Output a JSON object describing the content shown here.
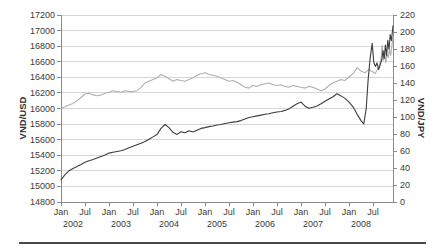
{
  "chart_data": {
    "type": "line",
    "title": "",
    "legend": "none",
    "grid": "horizontal",
    "colors": {
      "grid": "#d6d6d6",
      "axis": "#8c8c8c",
      "text": "#3a3a3a",
      "rule": "#4a4a4a"
    },
    "left_axis": {
      "label": "VND/USD",
      "min": 14800,
      "max": 17200,
      "step": 200,
      "ticks": [
        14800,
        15000,
        15200,
        15400,
        15600,
        15800,
        16000,
        16200,
        16400,
        16600,
        16800,
        17000,
        17200
      ]
    },
    "right_axis": {
      "label": "VND/JPY",
      "min": 0,
      "max": 220,
      "step": 20,
      "ticks": [
        0,
        20,
        40,
        60,
        80,
        100,
        120,
        140,
        160,
        180,
        200,
        220
      ]
    },
    "x_axis": {
      "unit": "months since Jan 2002",
      "range_months": 83,
      "tick_interval_months": 6,
      "tick_labels": [
        "Jan",
        "Jul",
        "Jan",
        "Jul",
        "Jan",
        "Jul",
        "Jan",
        "Jul",
        "Jan",
        "Jul",
        "Jan",
        "Jul",
        "Jan",
        "Jul"
      ],
      "year_labels": [
        "2002",
        "2003",
        "2004",
        "2005",
        "2006",
        "2007",
        "2008"
      ]
    },
    "series": [
      {
        "name": "VND/JPY",
        "axis": "right",
        "color": "#b0b0b0",
        "points": [
          [
            0,
            110
          ],
          [
            1,
            112
          ],
          [
            2,
            114
          ],
          [
            3,
            116
          ],
          [
            4,
            119
          ],
          [
            5,
            123
          ],
          [
            6,
            127
          ],
          [
            7,
            128
          ],
          [
            8,
            126
          ],
          [
            9,
            125
          ],
          [
            10,
            126
          ],
          [
            11,
            128
          ],
          [
            12,
            129
          ],
          [
            13,
            131
          ],
          [
            14,
            130
          ],
          [
            15,
            129
          ],
          [
            16,
            131
          ],
          [
            17,
            130
          ],
          [
            18,
            130
          ],
          [
            19,
            131
          ],
          [
            20,
            135
          ],
          [
            21,
            140
          ],
          [
            22,
            142
          ],
          [
            23,
            144
          ],
          [
            24,
            146
          ],
          [
            25,
            150
          ],
          [
            26,
            148
          ],
          [
            27,
            145
          ],
          [
            28,
            142
          ],
          [
            29,
            144
          ],
          [
            30,
            143
          ],
          [
            31,
            142
          ],
          [
            32,
            144
          ],
          [
            33,
            146
          ],
          [
            34,
            149
          ],
          [
            35,
            151
          ],
          [
            36,
            152
          ],
          [
            37,
            150
          ],
          [
            38,
            149
          ],
          [
            39,
            148
          ],
          [
            40,
            146
          ],
          [
            41,
            144
          ],
          [
            42,
            142
          ],
          [
            43,
            143
          ],
          [
            44,
            141
          ],
          [
            45,
            138
          ],
          [
            46,
            135
          ],
          [
            47,
            134
          ],
          [
            48,
            137
          ],
          [
            49,
            136
          ],
          [
            50,
            138
          ],
          [
            51,
            139
          ],
          [
            52,
            140
          ],
          [
            53,
            138
          ],
          [
            54,
            137
          ],
          [
            55,
            138
          ],
          [
            56,
            136
          ],
          [
            57,
            135
          ],
          [
            58,
            137
          ],
          [
            59,
            136
          ],
          [
            60,
            135
          ],
          [
            61,
            134
          ],
          [
            62,
            136
          ],
          [
            63,
            135
          ],
          [
            64,
            133
          ],
          [
            65,
            131
          ],
          [
            66,
            133
          ],
          [
            67,
            137
          ],
          [
            68,
            140
          ],
          [
            69,
            142
          ],
          [
            70,
            144
          ],
          [
            71,
            143
          ],
          [
            72,
            147
          ],
          [
            73,
            151
          ],
          [
            74,
            158
          ],
          [
            75,
            154
          ],
          [
            76,
            152
          ],
          [
            77,
            156
          ],
          [
            77.5,
            154
          ],
          [
            78,
            153
          ],
          [
            78.5,
            151
          ],
          [
            79,
            155
          ],
          [
            79.5,
            159
          ],
          [
            80,
            168
          ],
          [
            80.3,
            184
          ],
          [
            80.6,
            167
          ],
          [
            80.9,
            177
          ],
          [
            81.2,
            164
          ],
          [
            81.5,
            174
          ],
          [
            81.8,
            170
          ],
          [
            82.1,
            180
          ],
          [
            82.4,
            172
          ],
          [
            83,
            194
          ]
        ]
      },
      {
        "name": "VND/USD",
        "axis": "left",
        "color": "#3d3d3d",
        "points": [
          [
            0,
            15085
          ],
          [
            1,
            15150
          ],
          [
            2,
            15200
          ],
          [
            3,
            15230
          ],
          [
            4,
            15255
          ],
          [
            5,
            15280
          ],
          [
            6,
            15310
          ],
          [
            7,
            15330
          ],
          [
            8,
            15345
          ],
          [
            9,
            15365
          ],
          [
            10,
            15385
          ],
          [
            11,
            15405
          ],
          [
            12,
            15428
          ],
          [
            13,
            15438
          ],
          [
            14,
            15448
          ],
          [
            15,
            15458
          ],
          [
            16,
            15475
          ],
          [
            17,
            15495
          ],
          [
            18,
            15515
          ],
          [
            19,
            15535
          ],
          [
            20,
            15555
          ],
          [
            21,
            15578
          ],
          [
            22,
            15605
          ],
          [
            23,
            15635
          ],
          [
            24,
            15665
          ],
          [
            25,
            15745
          ],
          [
            26,
            15795
          ],
          [
            27,
            15755
          ],
          [
            28,
            15695
          ],
          [
            29,
            15668
          ],
          [
            30,
            15702
          ],
          [
            31,
            15690
          ],
          [
            32,
            15715
          ],
          [
            33,
            15698
          ],
          [
            34,
            15722
          ],
          [
            35,
            15745
          ],
          [
            36,
            15755
          ],
          [
            37,
            15768
          ],
          [
            38,
            15775
          ],
          [
            39,
            15788
          ],
          [
            40,
            15795
          ],
          [
            41,
            15808
          ],
          [
            42,
            15818
          ],
          [
            43,
            15825
          ],
          [
            44,
            15832
          ],
          [
            45,
            15845
          ],
          [
            46,
            15865
          ],
          [
            47,
            15885
          ],
          [
            48,
            15895
          ],
          [
            49,
            15905
          ],
          [
            50,
            15915
          ],
          [
            51,
            15925
          ],
          [
            52,
            15932
          ],
          [
            53,
            15945
          ],
          [
            54,
            15955
          ],
          [
            55,
            15962
          ],
          [
            56,
            15975
          ],
          [
            57,
            15995
          ],
          [
            58,
            16030
          ],
          [
            59,
            16062
          ],
          [
            60,
            16082
          ],
          [
            61,
            16030
          ],
          [
            62,
            16002
          ],
          [
            63,
            16015
          ],
          [
            64,
            16032
          ],
          [
            65,
            16060
          ],
          [
            66,
            16092
          ],
          [
            67,
            16122
          ],
          [
            68,
            16152
          ],
          [
            69,
            16190
          ],
          [
            70,
            16162
          ],
          [
            71,
            16130
          ],
          [
            72,
            16082
          ],
          [
            73,
            16022
          ],
          [
            74,
            15928
          ],
          [
            75,
            15845
          ],
          [
            75.7,
            15802
          ],
          [
            76.3,
            16000
          ],
          [
            76.8,
            16380
          ],
          [
            77.3,
            16650
          ],
          [
            77.8,
            16835
          ],
          [
            78.2,
            16590
          ],
          [
            78.6,
            16540
          ],
          [
            79,
            16585
          ],
          [
            79.4,
            16500
          ],
          [
            79.8,
            16560
          ],
          [
            80.2,
            16625
          ],
          [
            80.5,
            16745
          ],
          [
            80.8,
            16640
          ],
          [
            81.1,
            16815
          ],
          [
            81.4,
            16680
          ],
          [
            81.7,
            16875
          ],
          [
            82,
            16760
          ],
          [
            82.3,
            16950
          ],
          [
            82.6,
            16870
          ],
          [
            83,
            17060
          ]
        ]
      }
    ]
  }
}
